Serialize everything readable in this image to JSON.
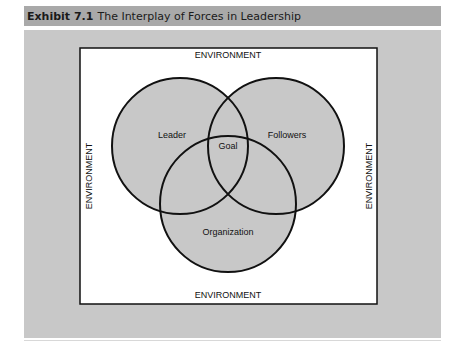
{
  "title": {
    "exhibit_number": "Exhibit 7.1",
    "caption": "The Interplay of Forces in Leadership"
  },
  "diagram": {
    "type": "venn",
    "environment_labels": {
      "top": "ENVIRONMENT",
      "bottom": "ENVIRONMENT",
      "left": "ENVIRONMENT",
      "right": "ENVIRONMENT"
    },
    "sets": [
      {
        "id": "leader",
        "label": "Leader"
      },
      {
        "id": "followers",
        "label": "Followers"
      },
      {
        "id": "organization",
        "label": "Organization"
      }
    ],
    "intersection_label": "Goal",
    "colors": {
      "circle_fill": "#c8c8c8",
      "circle_stroke": "#111111",
      "box_fill": "#ffffff",
      "panel": "#c8c8c8",
      "title_bar": "#a9a9a9"
    }
  }
}
